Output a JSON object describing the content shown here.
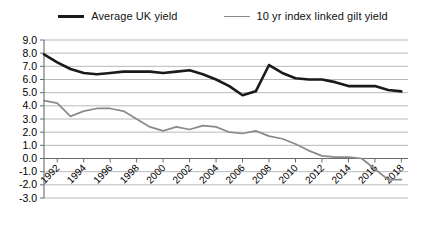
{
  "legend": {
    "position": "top-center",
    "entries": [
      {
        "label": "Average UK yield",
        "color": "#1a1a1a",
        "style": "thick"
      },
      {
        "label": "10 yr index linked gilt yield",
        "color": "#8a8a8a",
        "style": "thin"
      }
    ]
  },
  "chart_data": {
    "type": "line",
    "title": "",
    "subtitle": "",
    "xlabel": "",
    "ylabel": "",
    "grid": true,
    "legend_position": "top-center",
    "xlim": [
      1991,
      2018.5
    ],
    "ylim": [
      -3.0,
      9.0
    ],
    "ytick_labels": [
      "9.0",
      "8.0",
      "7.0",
      "6.0",
      "5.0",
      "4.0",
      "3.0",
      "2.0",
      "1.0",
      "0.0",
      "-1.0",
      "-2.0",
      "-3.0"
    ],
    "ytick_values": [
      9.0,
      8.0,
      7.0,
      6.0,
      5.0,
      4.0,
      3.0,
      2.0,
      1.0,
      0.0,
      -1.0,
      -2.0,
      -3.0
    ],
    "xtick_labels": [
      "1992",
      "1994",
      "1996",
      "1998",
      "2000",
      "2002",
      "2004",
      "2006",
      "2008",
      "2010",
      "2012",
      "2014",
      "2016",
      "2018"
    ],
    "xtick_values": [
      1992,
      1994,
      1996,
      1998,
      2000,
      2002,
      2004,
      2006,
      2008,
      2010,
      2012,
      2014,
      2016,
      2018
    ],
    "x": [
      1991,
      1992,
      1993,
      1994,
      1995,
      1996,
      1997,
      1998,
      1999,
      2000,
      2001,
      2002,
      2003,
      2004,
      2005,
      2006,
      2007,
      2008,
      2009,
      2010,
      2011,
      2012,
      2013,
      2014,
      2015,
      2016,
      2017,
      2018
    ],
    "series": [
      {
        "name": "Average UK yield",
        "color": "#1a1a1a",
        "values": [
          7.9,
          7.3,
          6.8,
          6.5,
          6.4,
          6.5,
          6.6,
          6.6,
          6.6,
          6.5,
          6.6,
          6.7,
          6.4,
          6.0,
          5.5,
          4.8,
          5.1,
          7.1,
          6.5,
          6.1,
          6.0,
          6.0,
          5.8,
          5.5,
          5.5,
          5.5,
          5.2,
          5.1
        ]
      },
      {
        "name": "10 yr index linked gilt yield",
        "color": "#8a8a8a",
        "values": [
          4.4,
          4.2,
          3.2,
          3.6,
          3.8,
          3.8,
          3.6,
          3.0,
          2.4,
          2.1,
          2.4,
          2.2,
          2.5,
          2.4,
          2.0,
          1.9,
          2.1,
          1.7,
          1.5,
          1.1,
          0.6,
          0.2,
          0.1,
          0.1,
          0.0,
          -0.8,
          -1.6,
          -1.6
        ]
      }
    ]
  }
}
